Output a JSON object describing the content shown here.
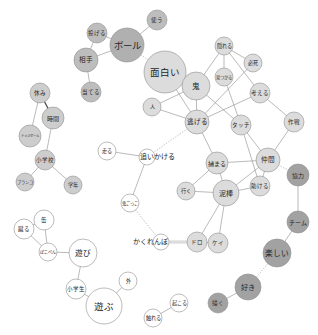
{
  "diagram": {
    "type": "co-occurrence network",
    "groups": {
      "community_1": {
        "color": "#bdbdbd"
      },
      "community_1_core": {
        "color": "#b0b0b0"
      },
      "community_2": {
        "color": "#dcdcdc"
      },
      "community_3": {
        "color": "#cdcdcd"
      },
      "community_4": {
        "color": "#a2a2a2"
      },
      "community_5": {
        "color": "#ffffff"
      }
    },
    "nodes": [
      {
        "label": "使う",
        "group": "community_1"
      },
      {
        "label": "投げる",
        "group": "community_1"
      },
      {
        "label": "ボール",
        "group": "community_1_core"
      },
      {
        "label": "相手",
        "group": "community_1"
      },
      {
        "label": "当てる",
        "group": "community_1"
      },
      {
        "label": "面白い",
        "group": "community_2"
      },
      {
        "label": "鬼",
        "group": "community_2"
      },
      {
        "label": "人",
        "group": "community_2"
      },
      {
        "label": "逃げる",
        "group": "community_2"
      },
      {
        "label": "隠れる",
        "group": "community_2"
      },
      {
        "label": "見つかる",
        "group": "community_2"
      },
      {
        "label": "必死",
        "group": "community_2"
      },
      {
        "label": "考える",
        "group": "community_2"
      },
      {
        "label": "タッチ",
        "group": "community_2"
      },
      {
        "label": "作戦",
        "group": "community_2"
      },
      {
        "label": "捕まる",
        "group": "community_2"
      },
      {
        "label": "仲間",
        "group": "community_2"
      },
      {
        "label": "助ける",
        "group": "community_2"
      },
      {
        "label": "泥棒",
        "group": "community_2"
      },
      {
        "label": "行く",
        "group": "community_2"
      },
      {
        "label": "ドロ",
        "group": "community_2"
      },
      {
        "label": "ケイ",
        "group": "community_2"
      },
      {
        "label": "休み",
        "group": "community_3"
      },
      {
        "label": "時間",
        "group": "community_3"
      },
      {
        "label": "ドッジボール",
        "group": "community_3"
      },
      {
        "label": "小学校",
        "group": "community_3"
      },
      {
        "label": "ブランコ",
        "group": "community_3"
      },
      {
        "label": "学年",
        "group": "community_3"
      },
      {
        "label": "協力",
        "group": "community_4"
      },
      {
        "label": "チーム",
        "group": "community_4"
      },
      {
        "label": "楽しい",
        "group": "community_4"
      },
      {
        "label": "好き",
        "group": "community_4"
      },
      {
        "label": "描く",
        "group": "community_4"
      },
      {
        "label": "走る",
        "group": "community_5"
      },
      {
        "label": "追いかける",
        "group": "community_5"
      },
      {
        "label": "鬼ごっこ",
        "group": "community_5"
      },
      {
        "label": "かくれんぼ",
        "group": "community_5"
      },
      {
        "label": "缶",
        "group": "community_5"
      },
      {
        "label": "蹴る",
        "group": "community_5"
      },
      {
        "label": "ぽこぺん",
        "group": "community_5"
      },
      {
        "label": "遊び",
        "group": "community_5"
      },
      {
        "label": "小学生",
        "group": "community_5"
      },
      {
        "label": "遊ぶ",
        "group": "community_5"
      },
      {
        "label": "外",
        "group": "community_5"
      },
      {
        "label": "起こる",
        "group": "community_5"
      },
      {
        "label": "触れる",
        "group": "community_5"
      }
    ],
    "edges": [
      {
        "source": "使う",
        "target": "ボール",
        "style": "solid"
      },
      {
        "source": "投げる",
        "target": "ボール",
        "style": "solid"
      },
      {
        "source": "投げる",
        "target": "相手",
        "style": "solid"
      },
      {
        "source": "相手",
        "target": "ボール",
        "style": "solid"
      },
      {
        "source": "相手",
        "target": "当てる",
        "style": "solid"
      },
      {
        "source": "ボール",
        "target": "面白い",
        "style": "dashed"
      },
      {
        "source": "面白い",
        "target": "鬼",
        "style": "solid"
      },
      {
        "source": "面白い",
        "target": "逃げる",
        "style": "solid"
      },
      {
        "source": "人",
        "target": "鬼",
        "style": "solid"
      },
      {
        "source": "人",
        "target": "逃げる",
        "style": "solid"
      },
      {
        "source": "鬼",
        "target": "逃げる",
        "style": "solid"
      },
      {
        "source": "鬼",
        "target": "隠れる",
        "style": "solid"
      },
      {
        "source": "鬼",
        "target": "タッチ",
        "style": "solid"
      },
      {
        "source": "隠れる",
        "target": "見つかる",
        "style": "solid"
      },
      {
        "source": "隠れる",
        "target": "必死",
        "style": "solid"
      },
      {
        "source": "隠れる",
        "target": "考える",
        "style": "solid"
      },
      {
        "source": "見つかる",
        "target": "タッチ",
        "style": "solid"
      },
      {
        "source": "必死",
        "target": "逃げる",
        "style": "solid"
      },
      {
        "source": "考える",
        "target": "逃げる",
        "style": "solid"
      },
      {
        "source": "考える",
        "target": "作戦",
        "style": "solid"
      },
      {
        "source": "逃げる",
        "target": "捕まる",
        "style": "solid"
      },
      {
        "source": "逃げる",
        "target": "追いかける",
        "style": "dashed"
      },
      {
        "source": "捕まる",
        "target": "仲間",
        "style": "solid"
      },
      {
        "source": "捕まる",
        "target": "泥棒",
        "style": "solid"
      },
      {
        "source": "捕まる",
        "target": "行く",
        "style": "solid"
      },
      {
        "source": "タッチ",
        "target": "仲間",
        "style": "solid"
      },
      {
        "source": "タッチ",
        "target": "助ける",
        "style": "solid"
      },
      {
        "source": "作戦",
        "target": "仲間",
        "style": "solid"
      },
      {
        "source": "仲間",
        "target": "協力",
        "style": "dashed"
      },
      {
        "source": "仲間",
        "target": "泥棒",
        "style": "solid"
      },
      {
        "source": "仲間",
        "target": "助ける",
        "style": "solid"
      },
      {
        "source": "助ける",
        "target": "泥棒",
        "style": "solid"
      },
      {
        "source": "泥棒",
        "target": "行く",
        "style": "solid"
      },
      {
        "source": "泥棒",
        "target": "ドロ",
        "style": "solid"
      },
      {
        "source": "泥棒",
        "target": "ケイ",
        "style": "solid"
      },
      {
        "source": "ドロ",
        "target": "ケイ",
        "style": "solid"
      },
      {
        "source": "かくれんぼ",
        "target": "ドロ",
        "style": "double"
      },
      {
        "source": "鬼ごっこ",
        "target": "かくれんぼ",
        "style": "dashed"
      },
      {
        "source": "走る",
        "target": "追いかける",
        "style": "solid"
      },
      {
        "source": "追いかける",
        "target": "鬼ごっこ",
        "style": "solid"
      },
      {
        "source": "協力",
        "target": "チーム",
        "style": "solid"
      },
      {
        "source": "チーム",
        "target": "楽しい",
        "style": "solid"
      },
      {
        "source": "楽しい",
        "target": "好き",
        "style": "dashed"
      },
      {
        "source": "休み",
        "target": "時間",
        "style": "bold"
      },
      {
        "source": "休み",
        "target": "ドッジボール",
        "style": "solid"
      },
      {
        "source": "時間",
        "target": "小学校",
        "style": "solid"
      },
      {
        "source": "小学校",
        "target": "ブランコ",
        "style": "solid"
      },
      {
        "source": "小学校",
        "target": "学年",
        "style": "solid"
      },
      {
        "source": "缶",
        "target": "蹴る",
        "style": "solid"
      },
      {
        "source": "缶",
        "target": "ぽこぺん",
        "style": "solid"
      },
      {
        "source": "蹴る",
        "target": "ぽこぺん",
        "style": "solid"
      },
      {
        "source": "ぽこぺん",
        "target": "遊び",
        "style": "solid"
      },
      {
        "source": "遊び",
        "target": "小学生",
        "style": "solid"
      },
      {
        "source": "小学生",
        "target": "遊ぶ",
        "style": "solid"
      },
      {
        "source": "遊ぶ",
        "target": "外",
        "style": "solid"
      },
      {
        "source": "起こる",
        "target": "触れる",
        "style": "solid"
      },
      {
        "source": "好き",
        "target": "描く",
        "style": "solid"
      }
    ]
  }
}
